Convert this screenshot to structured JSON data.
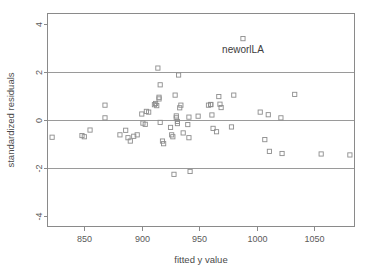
{
  "chart_data": {
    "type": "scatter",
    "title": "",
    "xlabel": "fitted y value",
    "ylabel": "standardized residuals",
    "xlim": [
      818,
      1085
    ],
    "ylim": [
      -4.45,
      4.45
    ],
    "xticks": [
      850,
      900,
      950,
      1000,
      1050
    ],
    "yticks": [
      4,
      2,
      0,
      -2,
      -4
    ],
    "xtick_labels": [
      "850",
      "900",
      "950",
      "1000",
      "1050"
    ],
    "ytick_labels": [
      "4",
      "2",
      "0",
      "-2",
      "-4"
    ],
    "grid": true,
    "gridlines_y": [
      2,
      0,
      -2
    ],
    "legend": "none",
    "marker": "open-square",
    "marker_color": "#8d8d8d",
    "points": [
      {
        "x": 822,
        "y": -0.72
      },
      {
        "x": 848,
        "y": -0.65
      },
      {
        "x": 850,
        "y": -0.7
      },
      {
        "x": 855,
        "y": -0.42
      },
      {
        "x": 868,
        "y": 0.62
      },
      {
        "x": 868,
        "y": 0.09
      },
      {
        "x": 881,
        "y": -0.62
      },
      {
        "x": 886,
        "y": -0.43
      },
      {
        "x": 888,
        "y": -0.74
      },
      {
        "x": 890,
        "y": -0.88
      },
      {
        "x": 893,
        "y": -0.68
      },
      {
        "x": 896,
        "y": -0.62
      },
      {
        "x": 900,
        "y": 0.25
      },
      {
        "x": 901,
        "y": -0.13
      },
      {
        "x": 903,
        "y": -0.18
      },
      {
        "x": 904,
        "y": 0.36
      },
      {
        "x": 906,
        "y": 0.33
      },
      {
        "x": 911,
        "y": 0.64
      },
      {
        "x": 912,
        "y": 0.69
      },
      {
        "x": 913,
        "y": 0.6
      },
      {
        "x": 914,
        "y": 2.17
      },
      {
        "x": 915,
        "y": 0.95
      },
      {
        "x": 915,
        "y": 0.88
      },
      {
        "x": 916,
        "y": 1.47
      },
      {
        "x": 916,
        "y": -0.1
      },
      {
        "x": 918,
        "y": -0.88
      },
      {
        "x": 919,
        "y": -0.99
      },
      {
        "x": 925,
        "y": -0.31
      },
      {
        "x": 926,
        "y": -0.62
      },
      {
        "x": 927,
        "y": -0.7
      },
      {
        "x": 928,
        "y": -2.27
      },
      {
        "x": 929,
        "y": 1.04
      },
      {
        "x": 930,
        "y": 0.17
      },
      {
        "x": 930,
        "y": 0.09
      },
      {
        "x": 931,
        "y": -0.06
      },
      {
        "x": 931,
        "y": -0.15
      },
      {
        "x": 932,
        "y": 1.88
      },
      {
        "x": 933,
        "y": 0.51
      },
      {
        "x": 934,
        "y": 0.62
      },
      {
        "x": 936,
        "y": -0.54
      },
      {
        "x": 940,
        "y": -0.19
      },
      {
        "x": 941,
        "y": 0.12
      },
      {
        "x": 941,
        "y": -0.74
      },
      {
        "x": 942,
        "y": -2.15
      },
      {
        "x": 949,
        "y": 0.16
      },
      {
        "x": 958,
        "y": 0.62
      },
      {
        "x": 960,
        "y": 0.65
      },
      {
        "x": 960,
        "y": 0.64
      },
      {
        "x": 961,
        "y": 0.21
      },
      {
        "x": 962,
        "y": -0.35
      },
      {
        "x": 965,
        "y": -0.49
      },
      {
        "x": 967,
        "y": 0.98
      },
      {
        "x": 968,
        "y": 0.66
      },
      {
        "x": 969,
        "y": 0.52
      },
      {
        "x": 978,
        "y": -0.29
      },
      {
        "x": 980,
        "y": 1.04
      },
      {
        "x": 988,
        "y": 3.4
      },
      {
        "x": 1003,
        "y": 0.33
      },
      {
        "x": 1007,
        "y": -0.82
      },
      {
        "x": 1010,
        "y": 0.22
      },
      {
        "x": 1011,
        "y": -1.31
      },
      {
        "x": 1021,
        "y": 0.09
      },
      {
        "x": 1022,
        "y": -1.4
      },
      {
        "x": 1033,
        "y": 1.07
      },
      {
        "x": 1056,
        "y": -1.42
      },
      {
        "x": 1081,
        "y": -1.46
      }
    ],
    "annotations": [
      {
        "text": "neworlLA",
        "x": 988,
        "y": 3.4,
        "dx": 0,
        "dy": -0.62
      }
    ]
  }
}
